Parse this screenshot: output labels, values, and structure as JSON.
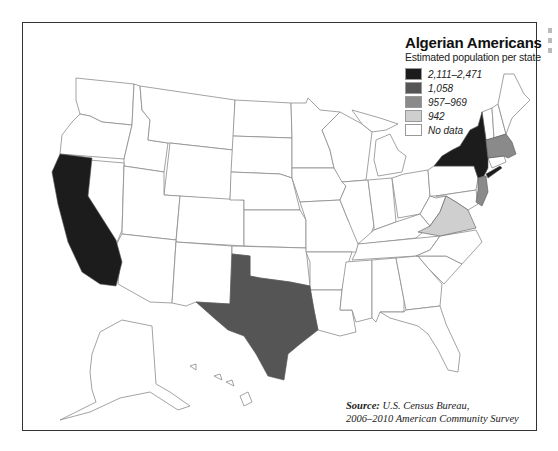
{
  "legend": {
    "title": "Algerian Americans",
    "subtitle": "Estimated population per state",
    "classes": [
      {
        "label": "2,111–2,471",
        "color": "#1c1c1c"
      },
      {
        "label": "1,058",
        "color": "#555555"
      },
      {
        "label": "957–969",
        "color": "#8a8a8a"
      },
      {
        "label": "942",
        "color": "#cfcfcf"
      },
      {
        "label": "No data",
        "color": "#ffffff"
      }
    ]
  },
  "source": {
    "label": "Source:",
    "line1": "U.S. Census Bureau,",
    "line2": "2006–2010 American Community Survey"
  },
  "states": {
    "California": "2,111–2,471",
    "New York": "2,111–2,471",
    "Texas": "1,058",
    "Massachusetts": "957–969",
    "New Jersey": "957–969",
    "Virginia": "942"
  },
  "colors": {
    "border": "#333333",
    "state_line": "#8c8c8c"
  }
}
